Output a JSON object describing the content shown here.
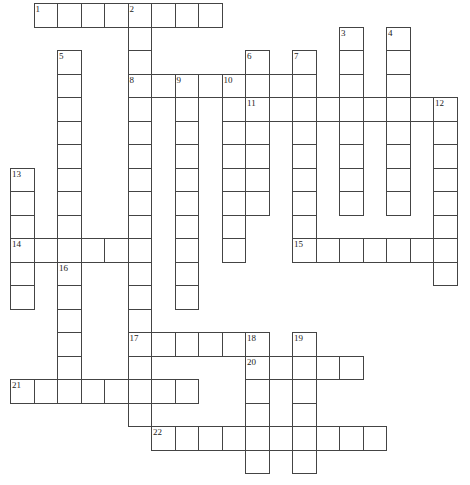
{
  "puzzle": {
    "title": "Crossword Puzzle Grid",
    "kind": "empty-crossword-grid",
    "width_px": 470,
    "height_px": 485,
    "cell_size_px": 23.5,
    "origin": {
      "x": 10,
      "y": 3
    },
    "colors": {
      "cell_border": "#444444",
      "cell_fill": "#ffffff",
      "number_text": "#222222",
      "page_background": "#ffffff"
    },
    "counts": {
      "entries": 22,
      "across_entries": 9,
      "down_entries": 13
    },
    "numbers": [
      "1",
      "2",
      "3",
      "4",
      "5",
      "6",
      "7",
      "8",
      "9",
      "10",
      "11",
      "12",
      "13",
      "14",
      "15",
      "16",
      "17",
      "18",
      "19",
      "20",
      "21",
      "22"
    ],
    "entries": [
      {
        "number": "1",
        "direction": "across",
        "row": 0,
        "col": 1,
        "length": 8
      },
      {
        "number": "2",
        "direction": "down",
        "row": 0,
        "col": 5,
        "length": 4
      },
      {
        "number": "3",
        "direction": "down",
        "row": 1,
        "col": 14,
        "length": 8
      },
      {
        "number": "4",
        "direction": "down",
        "row": 1,
        "col": 16,
        "length": 8
      },
      {
        "number": "5",
        "direction": "down",
        "row": 2,
        "col": 2,
        "length": 9
      },
      {
        "number": "6",
        "direction": "down",
        "row": 2,
        "col": 10,
        "length": 6
      },
      {
        "number": "7",
        "direction": "down",
        "row": 2,
        "col": 12,
        "length": 2
      },
      {
        "number": "8",
        "direction": "across",
        "row": 3,
        "col": 5,
        "length": 7
      },
      {
        "number": "8",
        "direction": "down",
        "row": 3,
        "col": 5,
        "length": 9
      },
      {
        "number": "9",
        "direction": "down",
        "row": 3,
        "col": 7,
        "length": 9
      },
      {
        "number": "10",
        "direction": "down",
        "row": 3,
        "col": 9,
        "length": 7
      },
      {
        "number": "11",
        "direction": "across",
        "row": 4,
        "col": 10,
        "length": 9
      },
      {
        "number": "12",
        "direction": "down",
        "row": 4,
        "col": 18,
        "length": 7
      },
      {
        "number": "13",
        "direction": "down",
        "row": 7,
        "col": 0,
        "length": 7
      },
      {
        "number": "14",
        "direction": "across",
        "row": 10,
        "col": 0,
        "length": 6
      },
      {
        "number": "15",
        "direction": "across",
        "row": 10,
        "col": 12,
        "length": 7
      },
      {
        "number": "16",
        "direction": "down",
        "row": 11,
        "col": 2,
        "length": 8
      },
      {
        "number": "17",
        "direction": "across",
        "row": 14,
        "col": 5,
        "length": 7
      },
      {
        "number": "17",
        "direction": "down",
        "row": 14,
        "col": 5,
        "length": 5
      },
      {
        "number": "18",
        "direction": "down",
        "row": 14,
        "col": 10,
        "length": 7
      },
      {
        "number": "19",
        "direction": "down",
        "row": 14,
        "col": 12,
        "length": 7
      },
      {
        "number": "20",
        "direction": "across",
        "row": 15,
        "col": 10,
        "length": 5
      },
      {
        "number": "21",
        "direction": "across",
        "row": 16,
        "col": 0,
        "length": 8
      },
      {
        "number": "22",
        "direction": "across",
        "row": 18,
        "col": 6,
        "length": 10
      }
    ],
    "cells": [
      {
        "r": 0,
        "c": 1,
        "n": "1"
      },
      {
        "r": 0,
        "c": 2
      },
      {
        "r": 0,
        "c": 3
      },
      {
        "r": 0,
        "c": 4
      },
      {
        "r": 0,
        "c": 5,
        "n": "2"
      },
      {
        "r": 0,
        "c": 6
      },
      {
        "r": 0,
        "c": 7
      },
      {
        "r": 0,
        "c": 8
      },
      {
        "r": 1,
        "c": 5
      },
      {
        "r": 1,
        "c": 14,
        "n": "3"
      },
      {
        "r": 1,
        "c": 16,
        "n": "4"
      },
      {
        "r": 2,
        "c": 2,
        "n": "5"
      },
      {
        "r": 2,
        "c": 5
      },
      {
        "r": 2,
        "c": 10,
        "n": "6"
      },
      {
        "r": 2,
        "c": 12,
        "n": "7"
      },
      {
        "r": 2,
        "c": 14
      },
      {
        "r": 2,
        "c": 16
      },
      {
        "r": 3,
        "c": 2
      },
      {
        "r": 3,
        "c": 5,
        "n": "8"
      },
      {
        "r": 3,
        "c": 6
      },
      {
        "r": 3,
        "c": 7,
        "n": "9"
      },
      {
        "r": 3,
        "c": 8
      },
      {
        "r": 3,
        "c": 9,
        "n": "10"
      },
      {
        "r": 3,
        "c": 10
      },
      {
        "r": 3,
        "c": 11
      },
      {
        "r": 3,
        "c": 12
      },
      {
        "r": 3,
        "c": 14
      },
      {
        "r": 3,
        "c": 16
      },
      {
        "r": 4,
        "c": 2
      },
      {
        "r": 4,
        "c": 5
      },
      {
        "r": 4,
        "c": 7
      },
      {
        "r": 4,
        "c": 9
      },
      {
        "r": 4,
        "c": 10,
        "n": "11"
      },
      {
        "r": 4,
        "c": 11
      },
      {
        "r": 4,
        "c": 12
      },
      {
        "r": 4,
        "c": 13
      },
      {
        "r": 4,
        "c": 14
      },
      {
        "r": 4,
        "c": 15
      },
      {
        "r": 4,
        "c": 16
      },
      {
        "r": 4,
        "c": 17
      },
      {
        "r": 4,
        "c": 18,
        "n": "12"
      },
      {
        "r": 5,
        "c": 2
      },
      {
        "r": 5,
        "c": 5
      },
      {
        "r": 5,
        "c": 7
      },
      {
        "r": 5,
        "c": 9
      },
      {
        "r": 5,
        "c": 10
      },
      {
        "r": 5,
        "c": 12
      },
      {
        "r": 5,
        "c": 14
      },
      {
        "r": 5,
        "c": 16
      },
      {
        "r": 5,
        "c": 18
      },
      {
        "r": 6,
        "c": 2
      },
      {
        "r": 6,
        "c": 5
      },
      {
        "r": 6,
        "c": 7
      },
      {
        "r": 6,
        "c": 9
      },
      {
        "r": 6,
        "c": 10
      },
      {
        "r": 6,
        "c": 12
      },
      {
        "r": 6,
        "c": 14
      },
      {
        "r": 6,
        "c": 16
      },
      {
        "r": 6,
        "c": 18
      },
      {
        "r": 7,
        "c": 0,
        "n": "13"
      },
      {
        "r": 7,
        "c": 2
      },
      {
        "r": 7,
        "c": 5
      },
      {
        "r": 7,
        "c": 7
      },
      {
        "r": 7,
        "c": 9
      },
      {
        "r": 7,
        "c": 10
      },
      {
        "r": 7,
        "c": 12
      },
      {
        "r": 7,
        "c": 14
      },
      {
        "r": 7,
        "c": 16
      },
      {
        "r": 7,
        "c": 18
      },
      {
        "r": 8,
        "c": 0
      },
      {
        "r": 8,
        "c": 2
      },
      {
        "r": 8,
        "c": 5
      },
      {
        "r": 8,
        "c": 7
      },
      {
        "r": 8,
        "c": 9
      },
      {
        "r": 8,
        "c": 10
      },
      {
        "r": 8,
        "c": 12
      },
      {
        "r": 8,
        "c": 14
      },
      {
        "r": 8,
        "c": 16
      },
      {
        "r": 8,
        "c": 18
      },
      {
        "r": 9,
        "c": 0
      },
      {
        "r": 9,
        "c": 2
      },
      {
        "r": 9,
        "c": 5
      },
      {
        "r": 9,
        "c": 7
      },
      {
        "r": 9,
        "c": 9
      },
      {
        "r": 9,
        "c": 12
      },
      {
        "r": 9,
        "c": 18
      },
      {
        "r": 10,
        "c": 0,
        "n": "14"
      },
      {
        "r": 10,
        "c": 1
      },
      {
        "r": 10,
        "c": 2
      },
      {
        "r": 10,
        "c": 3
      },
      {
        "r": 10,
        "c": 4
      },
      {
        "r": 10,
        "c": 5
      },
      {
        "r": 10,
        "c": 7
      },
      {
        "r": 10,
        "c": 9
      },
      {
        "r": 10,
        "c": 12,
        "n": "15"
      },
      {
        "r": 10,
        "c": 13
      },
      {
        "r": 10,
        "c": 14
      },
      {
        "r": 10,
        "c": 15
      },
      {
        "r": 10,
        "c": 16
      },
      {
        "r": 10,
        "c": 17
      },
      {
        "r": 10,
        "c": 18
      },
      {
        "r": 11,
        "c": 0
      },
      {
        "r": 11,
        "c": 2,
        "n": "16"
      },
      {
        "r": 11,
        "c": 5
      },
      {
        "r": 11,
        "c": 7
      },
      {
        "r": 11,
        "c": 18
      },
      {
        "r": 12,
        "c": 0
      },
      {
        "r": 12,
        "c": 2
      },
      {
        "r": 12,
        "c": 5
      },
      {
        "r": 12,
        "c": 7
      },
      {
        "r": 13,
        "c": 2
      },
      {
        "r": 13,
        "c": 5
      },
      {
        "r": 14,
        "c": 2
      },
      {
        "r": 14,
        "c": 5,
        "n": "17"
      },
      {
        "r": 14,
        "c": 6
      },
      {
        "r": 14,
        "c": 7
      },
      {
        "r": 14,
        "c": 8
      },
      {
        "r": 14,
        "c": 9
      },
      {
        "r": 14,
        "c": 10,
        "n": "18"
      },
      {
        "r": 14,
        "c": 12,
        "n": "19"
      },
      {
        "r": 15,
        "c": 2
      },
      {
        "r": 15,
        "c": 5
      },
      {
        "r": 15,
        "c": 10,
        "n": "20"
      },
      {
        "r": 15,
        "c": 11
      },
      {
        "r": 15,
        "c": 12
      },
      {
        "r": 15,
        "c": 13
      },
      {
        "r": 15,
        "c": 14
      },
      {
        "r": 16,
        "c": 0,
        "n": "21"
      },
      {
        "r": 16,
        "c": 1
      },
      {
        "r": 16,
        "c": 2
      },
      {
        "r": 16,
        "c": 3
      },
      {
        "r": 16,
        "c": 4
      },
      {
        "r": 16,
        "c": 5
      },
      {
        "r": 16,
        "c": 6
      },
      {
        "r": 16,
        "c": 7
      },
      {
        "r": 16,
        "c": 10
      },
      {
        "r": 16,
        "c": 12
      },
      {
        "r": 17,
        "c": 5
      },
      {
        "r": 17,
        "c": 10
      },
      {
        "r": 17,
        "c": 12
      },
      {
        "r": 18,
        "c": 6,
        "n": "22"
      },
      {
        "r": 18,
        "c": 7
      },
      {
        "r": 18,
        "c": 8
      },
      {
        "r": 18,
        "c": 9
      },
      {
        "r": 18,
        "c": 10
      },
      {
        "r": 18,
        "c": 11
      },
      {
        "r": 18,
        "c": 12
      },
      {
        "r": 18,
        "c": 13
      },
      {
        "r": 18,
        "c": 14
      },
      {
        "r": 18,
        "c": 15
      },
      {
        "r": 19,
        "c": 10
      },
      {
        "r": 19,
        "c": 12
      }
    ]
  }
}
